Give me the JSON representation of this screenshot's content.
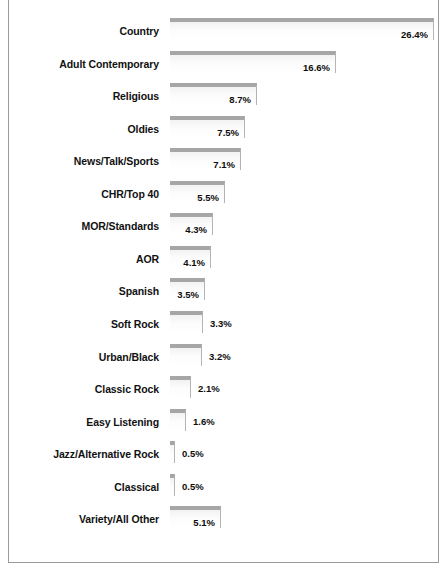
{
  "chart_data": {
    "type": "bar",
    "orientation": "horizontal",
    "title": "",
    "subtitle": "",
    "xlabel": "",
    "ylabel": "",
    "xlim": [
      0,
      27
    ],
    "grid": false,
    "legend": null,
    "value_suffix": "%",
    "categories": [
      "Country",
      "Adult Contemporary",
      "Religious",
      "Oldies",
      "News/Talk/Sports",
      "CHR/Top 40",
      "MOR/Standards",
      "AOR",
      "Spanish",
      "Soft Rock",
      "Urban/Black",
      "Classic Rock",
      "Easy Listening",
      "Jazz/Alternative Rock",
      "Classical",
      "Variety/All Other"
    ],
    "values": [
      26.4,
      16.6,
      8.7,
      7.5,
      7.1,
      5.5,
      4.3,
      4.1,
      3.5,
      3.3,
      3.2,
      2.1,
      1.6,
      0.5,
      0.5,
      5.1
    ],
    "value_labels": [
      "26.4%",
      "16.6%",
      "8.7%",
      "7.5%",
      "7.1%",
      "5.5%",
      "4.3%",
      "4.1%",
      "3.5%",
      "3.3%",
      "3.2%",
      "2.1%",
      "1.6%",
      "0.5%",
      "0.5%",
      "5.1%"
    ],
    "label_placement": [
      "inside",
      "inside",
      "inside",
      "inside",
      "inside",
      "inside",
      "inside",
      "inside",
      "inside",
      "outside",
      "outside",
      "outside",
      "outside",
      "outside",
      "outside",
      "inside"
    ],
    "colors": {
      "bar_top": "#a6a6a6",
      "bar_fill": "#fbfbfb",
      "bar_edge": "#b4b4b4",
      "label_text": "#111111",
      "value_text": "#0d0d0d",
      "frame_border": "#9a9a9a",
      "background": "#ffffff"
    }
  }
}
